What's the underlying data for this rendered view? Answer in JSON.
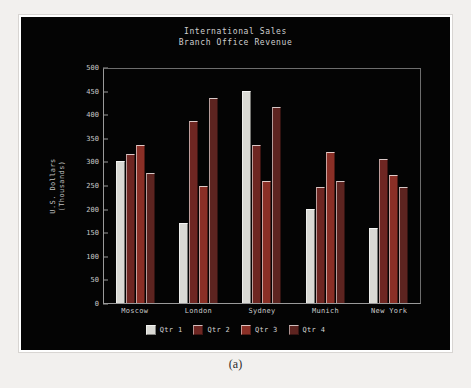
{
  "figure": {
    "caption": "(a)",
    "background_color": "#f2f0ee",
    "frame_color": "#ffffff"
  },
  "chart_data": {
    "type": "bar",
    "title": "International Sales",
    "subtitle": "Branch Office Revenue",
    "xlabel": "",
    "ylabel": "U.S. Dollars\n(Thousands)",
    "ylabel_line1": "U.S. Dollars",
    "ylabel_line2": "(Thousands)",
    "categories": [
      "Moscow",
      "London",
      "Sydney",
      "Munich",
      "New York"
    ],
    "series": [
      {
        "name": "Qtr 1",
        "color": "#d9d9d4",
        "values": [
          300,
          170,
          450,
          200,
          158
        ]
      },
      {
        "name": "Qtr 2",
        "color": "#6e2622",
        "values": [
          315,
          385,
          335,
          245,
          305
        ]
      },
      {
        "name": "Qtr 3",
        "color": "#8a2f26",
        "values": [
          335,
          248,
          258,
          320,
          272
        ]
      },
      {
        "name": "Qtr 4",
        "color": "#5d2420",
        "values": [
          275,
          435,
          415,
          258,
          245
        ]
      }
    ],
    "ylim": [
      0,
      500
    ],
    "yticks": [
      0,
      50,
      100,
      150,
      200,
      250,
      300,
      350,
      400,
      450,
      500
    ],
    "ytick_labels": [
      "0",
      "50",
      "100",
      "150",
      "200",
      "250",
      "300",
      "350",
      "400",
      "450",
      "500"
    ],
    "grid": false,
    "legend_position": "bottom",
    "plot_background": "#040404",
    "axis_color": "#9a9a9a",
    "text_color": "#cfcfcf"
  }
}
